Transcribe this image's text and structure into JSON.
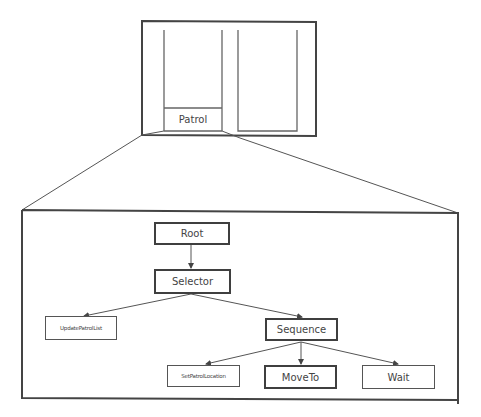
{
  "colors": {
    "stroke": "#444444",
    "background": "#ffffff",
    "text": "#3a3a3a"
  },
  "window": {
    "panels": [
      "left-panel",
      "right-panel"
    ],
    "selected_label": "Patrol"
  },
  "tree": {
    "root": "Root",
    "selector": "Selector",
    "update_patrol_list": "UpdatePatrolList",
    "sequence": "Sequence",
    "set_patrol_location": "SetPatrolLocation",
    "move_to": "MoveTo",
    "wait": "Wait"
  },
  "edges": [
    [
      "Root",
      "Selector"
    ],
    [
      "Selector",
      "UpdatePatrolList"
    ],
    [
      "Selector",
      "Sequence"
    ],
    [
      "Sequence",
      "SetPatrolLocation"
    ],
    [
      "Sequence",
      "MoveTo"
    ],
    [
      "Sequence",
      "Wait"
    ]
  ]
}
